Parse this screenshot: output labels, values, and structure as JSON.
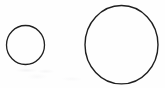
{
  "figure": {
    "background_color": "#fefefe",
    "stroke_color": "#1a1a1a",
    "width": 165,
    "height": 88,
    "caption": ""
  },
  "chart_data": {
    "type": "scatter",
    "subtitle": "",
    "xlabel": "",
    "ylabel": "",
    "xlim": [
      0,
      165
    ],
    "ylim": [
      0,
      88
    ],
    "grid": false,
    "legend": "none",
    "annotations": [],
    "categories": [
      "small-circle",
      "large-circle"
    ],
    "values": [
      38,
      76
    ],
    "series": [
      {
        "name": "circle-diameter-px",
        "values": [
          38,
          76
        ]
      }
    ],
    "shapes": [
      {
        "id": "small-circle",
        "label": "Small circle",
        "kind": "ellipse",
        "cx": 25.5,
        "cy": 45.0,
        "rx": 19.0,
        "ry": 19.5,
        "diameter": 38,
        "stroke": "#1f1f1f",
        "stroke_width": 1.3,
        "fill": "none"
      },
      {
        "id": "large-circle",
        "label": "Large circle",
        "kind": "ellipse",
        "cx": 121.5,
        "cy": 44.7,
        "rx": 36.5,
        "ry": 39.2,
        "diameter": 76,
        "stroke": "#1f1f1f",
        "stroke_width": 1.4,
        "fill": "none"
      }
    ]
  }
}
